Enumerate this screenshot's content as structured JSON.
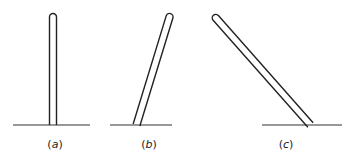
{
  "figure": {
    "panels": [
      {
        "id": "a",
        "label": "(a)",
        "label_letter": "a",
        "description": "vertical rod standing on ground line"
      },
      {
        "id": "b",
        "label": "(b)",
        "label_letter": "b",
        "description": "rod tilted slightly to the right"
      },
      {
        "id": "c",
        "label": "(c)",
        "label_letter": "c",
        "description": "rod tilted strongly to the left"
      }
    ],
    "colors": {
      "stroke": "#222222",
      "background": "#ffffff"
    }
  }
}
